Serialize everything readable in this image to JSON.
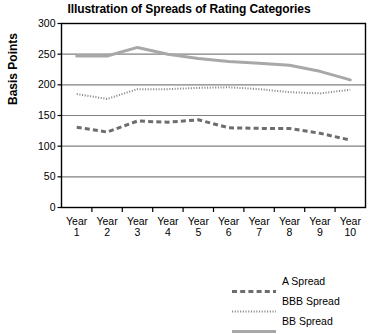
{
  "chart_data": {
    "type": "line",
    "title": "Illustration of Spreads of Rating Categories",
    "xlabel": "",
    "ylabel": "Basis Points",
    "categories": [
      "Year 1",
      "Year 2",
      "Year 3",
      "Year 4",
      "Year 5",
      "Year 6",
      "Year 7",
      "Year 8",
      "Year 9",
      "Year 10"
    ],
    "x_tick_lines": [
      [
        "Year",
        "1"
      ],
      [
        "Year",
        "2"
      ],
      [
        "Year",
        "3"
      ],
      [
        "Year",
        "4"
      ],
      [
        "Year",
        "5"
      ],
      [
        "Year",
        "6"
      ],
      [
        "Year",
        "7"
      ],
      [
        "Year",
        "8"
      ],
      [
        "Year",
        "9"
      ],
      [
        "Year",
        "10"
      ]
    ],
    "ylim": [
      0,
      300
    ],
    "y_ticks": [
      0,
      50,
      100,
      150,
      200,
      250,
      300
    ],
    "y_tick_labels": [
      "0",
      "50",
      "100",
      "150",
      "200",
      "250",
      "300"
    ],
    "grid": true,
    "grid_axis": "y",
    "legend_position": "bottom-right",
    "series": [
      {
        "name": "A Spread",
        "style": "dashed",
        "color": "#6d6d6d",
        "values": [
          131,
          123,
          141,
          139,
          143,
          130,
          129,
          129,
          121,
          110
        ]
      },
      {
        "name": "BBB Spread",
        "style": "dotted",
        "color": "#8a8a8a",
        "values": [
          185,
          177,
          193,
          193,
          195,
          196,
          193,
          188,
          186,
          192
        ]
      },
      {
        "name": "BB Spread",
        "style": "solid",
        "color": "#a8a8a8",
        "values": [
          247,
          247,
          261,
          250,
          243,
          238,
          235,
          232,
          222,
          208
        ]
      }
    ]
  },
  "legend": {
    "entries": [
      {
        "label": "A Spread"
      },
      {
        "label": "BBB Spread"
      },
      {
        "label": "BB Spread"
      }
    ]
  },
  "colors": {
    "a_spread": "#6d6d6d",
    "bbb_spread": "#8a8a8a",
    "bb_spread": "#a8a8a8",
    "axis": "#000000",
    "grid": "#808080",
    "background": "#ffffff"
  }
}
